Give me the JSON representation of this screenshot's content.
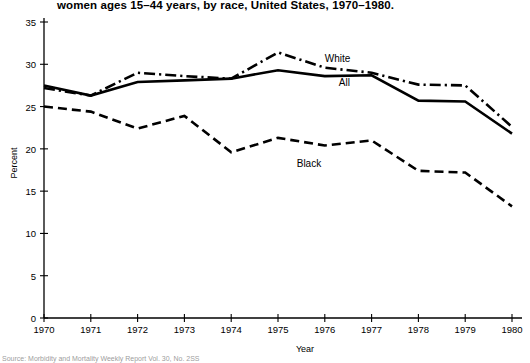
{
  "chart_data": {
    "type": "line",
    "title": "women ages 15–44 years, by race, United States, 1970–1980.",
    "xlabel": "Year",
    "ylabel": "Percent",
    "xlim": [
      1970,
      1980
    ],
    "ylim": [
      0,
      35
    ],
    "ytick_values": [
      0,
      5,
      10,
      15,
      20,
      25,
      30,
      35
    ],
    "ytick_labels": [
      "0",
      "5",
      "10",
      "15",
      "20",
      "25",
      "30",
      "35"
    ],
    "grid": false,
    "legend_position": "inline-annotation",
    "categories": [
      1970,
      1971,
      1972,
      1973,
      1974,
      1975,
      1976,
      1977,
      1978,
      1979,
      1980
    ],
    "xtick_labels": [
      "1970",
      "1971",
      "1972",
      "1973",
      "1974",
      "1975",
      "1976",
      "1977",
      "1978",
      "1979",
      "1980"
    ],
    "series": [
      {
        "name": "White",
        "linestyle": "dash-dot",
        "color": "#000000",
        "values": [
          27.2,
          26.3,
          29.0,
          28.6,
          28.3,
          31.4,
          29.6,
          29.0,
          27.6,
          27.5,
          22.6
        ]
      },
      {
        "name": "All",
        "linestyle": "solid",
        "color": "#000000",
        "values": [
          27.5,
          26.3,
          27.9,
          28.1,
          28.3,
          29.3,
          28.6,
          28.7,
          25.7,
          25.6,
          21.8
        ]
      },
      {
        "name": "Black",
        "linestyle": "dashed",
        "color": "#000000",
        "values": [
          25.0,
          24.4,
          22.4,
          23.9,
          19.6,
          21.3,
          20.4,
          21.0,
          17.4,
          17.2,
          13.2
        ]
      }
    ],
    "annotations": [
      {
        "text": "White",
        "x": 1976.0,
        "y": 30.6
      },
      {
        "text": "All",
        "x": 1976.3,
        "y": 27.8
      },
      {
        "text": "Black",
        "x": 1975.4,
        "y": 18.2
      }
    ]
  },
  "source": {
    "text": "Source: Morbidity and Mortality Weekly Report Vol. 30, No. 2SS"
  }
}
